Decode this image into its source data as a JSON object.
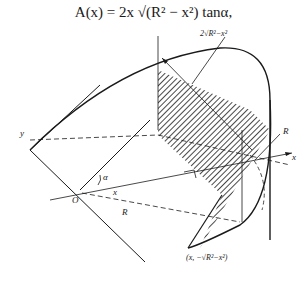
{
  "formula": {
    "text": "A(x) = 2x √(R² − x²) tanα,",
    "lhs": "A(x) = 2x",
    "radical": "√R² − x²",
    "rhs": "tanα，"
  },
  "figure": {
    "labels": {
      "top_dimension": "2√R²−x²",
      "y_axis": "y",
      "x_axis": "x",
      "origin": "O",
      "angle": "α",
      "x_segment": "x",
      "radius_right": "R",
      "radius_bottom": "R",
      "point": "(x, −√R²−x²)"
    }
  }
}
